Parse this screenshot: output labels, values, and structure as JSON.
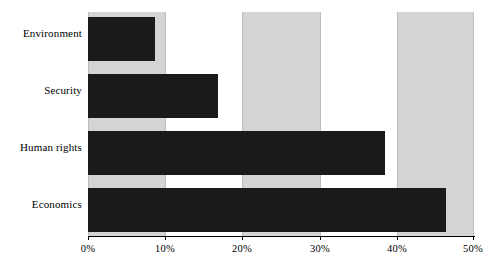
{
  "chart_data": {
    "type": "bar",
    "orientation": "horizontal",
    "title": "",
    "xlabel": "",
    "ylabel": "",
    "categories": [
      "Environment",
      "Security",
      "Human rights",
      "Economics"
    ],
    "values": [
      8.7,
      16.8,
      38.5,
      46.4
    ],
    "value_unit": "%",
    "xlim": [
      0,
      50
    ],
    "xticks": [
      0,
      10,
      20,
      30,
      40,
      50
    ],
    "xtick_labels": [
      "0%",
      "10%",
      "20%",
      "30%",
      "40%",
      "50%"
    ],
    "grid": true,
    "legend": null,
    "series": [
      {
        "name": "",
        "values": [
          8.7,
          16.8,
          38.5,
          46.4
        ]
      }
    ],
    "bands": [
      {
        "from": 0,
        "to": 10,
        "shaded": true
      },
      {
        "from": 10,
        "to": 20,
        "shaded": false
      },
      {
        "from": 20,
        "to": 30,
        "shaded": true
      },
      {
        "from": 30,
        "to": 40,
        "shaded": false
      },
      {
        "from": 40,
        "to": 50,
        "shaded": true
      }
    ],
    "colors": {
      "bar": "#1a1a1a",
      "band": "#d4d4d4",
      "plot_background": "#ffffff",
      "gridline": "#bdbdbd",
      "axis": "#000000",
      "text": "#000000"
    }
  }
}
